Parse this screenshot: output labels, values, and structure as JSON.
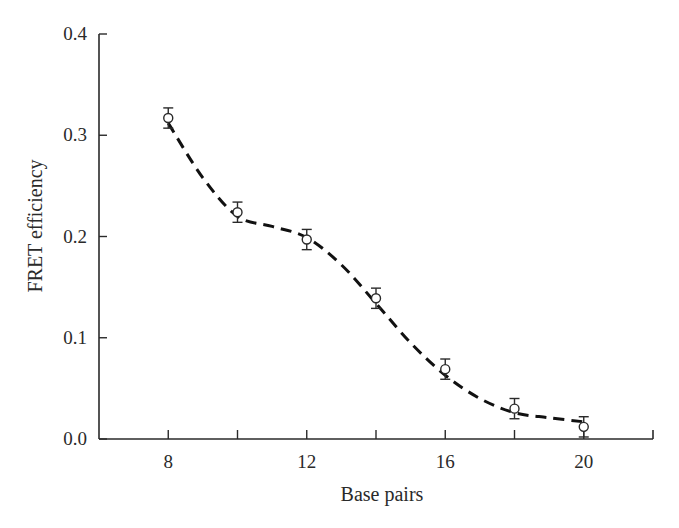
{
  "chart_data": {
    "type": "scatter",
    "title": "",
    "xlabel": "Base pairs",
    "ylabel": "FRET efficiency",
    "xlim": [
      6,
      22
    ],
    "ylim": [
      0.0,
      0.4
    ],
    "grid": false,
    "legend": null,
    "x_ticks": [
      8,
      10,
      12,
      14,
      16,
      18,
      20
    ],
    "x_tick_labels": [
      "8",
      "",
      "12",
      "",
      "16",
      "",
      "20"
    ],
    "y_ticks": [
      0.0,
      0.1,
      0.2,
      0.3,
      0.4
    ],
    "y_tick_labels": [
      "0.0",
      "0.1",
      "0.2",
      "0.3",
      "0.4"
    ],
    "series": [
      {
        "name": "measured",
        "marker": "open-circle",
        "x": [
          8,
          10,
          12,
          14,
          16,
          18,
          20
        ],
        "y": [
          0.317,
          0.224,
          0.197,
          0.139,
          0.069,
          0.03,
          0.012
        ],
        "error": [
          0.01,
          0.01,
          0.01,
          0.01,
          0.01,
          0.01,
          0.01
        ]
      },
      {
        "name": "fit",
        "style": "dashed-line",
        "x": [
          8,
          9,
          10,
          11,
          12,
          13,
          14,
          15,
          16,
          17,
          18,
          19,
          20
        ],
        "y": [
          0.312,
          0.258,
          0.22,
          0.21,
          0.199,
          0.172,
          0.134,
          0.095,
          0.063,
          0.04,
          0.026,
          0.021,
          0.017
        ]
      }
    ]
  }
}
